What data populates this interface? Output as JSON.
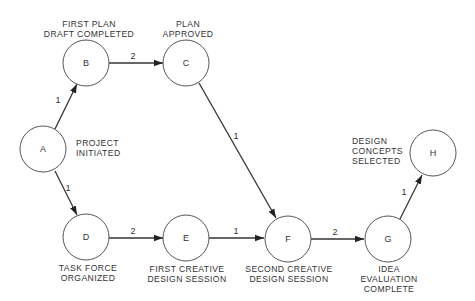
{
  "diagram": {
    "type": "PERT network",
    "nodes": [
      {
        "id": "A",
        "cx": 43,
        "cy": 149,
        "label_lines": [
          "PROJECT",
          "INITIATED"
        ],
        "label_x": 76,
        "label_y": 146,
        "anchor": "start"
      },
      {
        "id": "B",
        "cx": 86,
        "cy": 63,
        "label_lines": [
          "FIRST PLAN",
          "DRAFT COMPLETED"
        ],
        "label_x": 89,
        "label_y": 27,
        "anchor": "middle"
      },
      {
        "id": "C",
        "cx": 186,
        "cy": 63,
        "label_lines": [
          "PLAN",
          "APPROVED"
        ],
        "label_x": 188,
        "label_y": 27,
        "anchor": "middle"
      },
      {
        "id": "D",
        "cx": 86,
        "cy": 237,
        "label_lines": [
          "TASK FORCE",
          "ORGANIZED"
        ],
        "label_x": 88,
        "label_y": 271,
        "anchor": "middle"
      },
      {
        "id": "E",
        "cx": 186,
        "cy": 238,
        "label_lines": [
          "FIRST CREATIVE",
          "DESIGN SESSION"
        ],
        "label_x": 187,
        "label_y": 272,
        "anchor": "middle"
      },
      {
        "id": "F",
        "cx": 288,
        "cy": 239,
        "label_lines": [
          "SECOND CREATIVE",
          "DESIGN SESSION"
        ],
        "label_x": 289,
        "label_y": 272,
        "anchor": "middle"
      },
      {
        "id": "G",
        "cx": 388,
        "cy": 239,
        "label_lines": [
          "IDEA",
          "EVALUATION",
          "COMPLETE"
        ],
        "label_x": 389,
        "label_y": 272,
        "anchor": "middle"
      },
      {
        "id": "H",
        "cx": 433,
        "cy": 153,
        "label_lines": [
          "DESIGN",
          "CONCEPTS",
          "SELECTED"
        ],
        "label_x": 352,
        "label_y": 144,
        "anchor": "start"
      }
    ],
    "edges": [
      {
        "from": "A",
        "to": "B",
        "weight": "1",
        "x1": 55,
        "y1": 129,
        "x2": 77,
        "y2": 84,
        "wx": 58,
        "wy": 103
      },
      {
        "from": "B",
        "to": "C",
        "weight": "2",
        "x1": 109,
        "y1": 63,
        "x2": 163,
        "y2": 63,
        "wx": 133,
        "wy": 59
      },
      {
        "from": "A",
        "to": "D",
        "weight": "1",
        "x1": 55,
        "y1": 171,
        "x2": 77,
        "y2": 215,
        "wx": 68,
        "wy": 191
      },
      {
        "from": "D",
        "to": "E",
        "weight": "2",
        "x1": 109,
        "y1": 238,
        "x2": 163,
        "y2": 238,
        "wx": 133,
        "wy": 234
      },
      {
        "from": "C",
        "to": "F",
        "weight": "1",
        "x1": 199,
        "y1": 83,
        "x2": 276,
        "y2": 218,
        "wx": 236,
        "wy": 139
      },
      {
        "from": "E",
        "to": "F",
        "weight": "1",
        "x1": 209,
        "y1": 238,
        "x2": 264,
        "y2": 238,
        "wx": 236,
        "wy": 234
      },
      {
        "from": "F",
        "to": "G",
        "weight": "2",
        "x1": 311,
        "y1": 239,
        "x2": 364,
        "y2": 239,
        "wx": 335,
        "wy": 235
      },
      {
        "from": "G",
        "to": "H",
        "weight": "1",
        "x1": 400,
        "y1": 219,
        "x2": 422,
        "y2": 175,
        "wx": 404,
        "wy": 195
      }
    ]
  }
}
